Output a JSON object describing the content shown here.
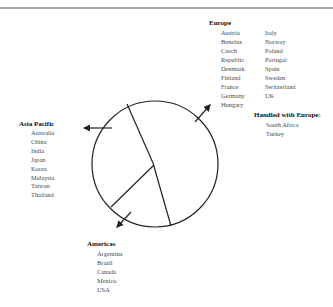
{
  "diagram": {
    "type": "pie-regions",
    "line_color": "#222222",
    "text_color": "#4a4a4a",
    "heading_color": "#111111"
  },
  "europe": {
    "heading": "Europe",
    "col1": [
      "Austria",
      "Benelux",
      "Czech",
      "Republic",
      "Denmark",
      "Finland",
      "France",
      "Germany",
      "Hungary"
    ],
    "col2": [
      "Italy",
      "Norway",
      "Poland",
      "Portugal",
      "Spain",
      "Sweden",
      "Switzerland",
      "UK"
    ]
  },
  "handled_with_europe": {
    "heading": "Handled with Europe:",
    "items": [
      "South Africa",
      "Turkey"
    ]
  },
  "asia_pacific": {
    "heading": "Asia Pacific",
    "items": [
      "Australia",
      "China",
      "India",
      "Japan",
      "Korea",
      "Malaysia",
      "Taiwan",
      "Thailand"
    ]
  },
  "americas": {
    "heading": "Americas",
    "items": [
      "Argentina",
      "Brazil",
      "Canada",
      "Mexico",
      "USA"
    ]
  }
}
